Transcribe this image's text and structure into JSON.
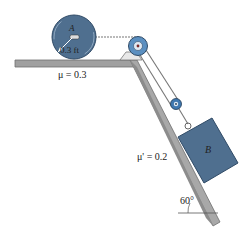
{
  "figure": {
    "cylinder": {
      "label": "A",
      "radius_label": "0.3 ft"
    },
    "block": {
      "label": "B"
    },
    "horizontal_surface": {
      "friction_label": "μ = 0.3"
    },
    "incline": {
      "friction_label": "μ' = 0.2",
      "angle_label": "60°"
    },
    "colors": {
      "body_blue": "#4f6f8f",
      "body_blue_dark": "#2f4a66",
      "pulley_blue": "#5b8fc0",
      "surface_gray": "#9a9a9a",
      "surface_dark": "#6e6e6e",
      "rope": "#777777"
    }
  }
}
